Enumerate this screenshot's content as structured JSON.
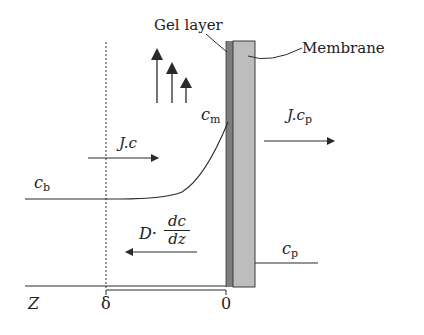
{
  "diagram": {
    "labels": {
      "gel_layer": "Gel layer",
      "membrane": "Membrane",
      "c_m_main": "c",
      "c_m_sub": "m",
      "flux_c": "J.c",
      "flux_cp_main": "J.c",
      "flux_cp_sub": "p",
      "c_b_main": "c",
      "c_b_sub": "b",
      "diffusion_prefix": "D·",
      "diffusion_num": "dc",
      "diffusion_den": "dz",
      "c_p_main": "c",
      "c_p_sub": "p",
      "axis_z": "Z",
      "axis_delta": "δ",
      "axis_zero": "0"
    },
    "colors": {
      "line": "#2a2a2a",
      "gel_layer": "#7d7d7d",
      "membrane": "#bdbdbd",
      "background": "#ffffff"
    }
  }
}
